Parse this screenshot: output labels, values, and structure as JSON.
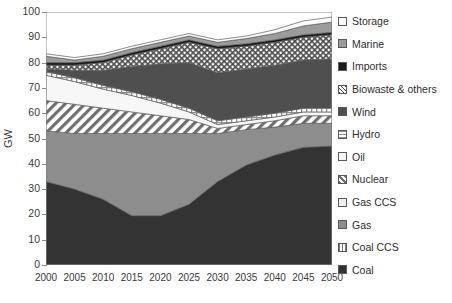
{
  "chart_data": {
    "type": "area",
    "stacked": true,
    "title": "",
    "xlabel": "",
    "ylabel": "GW",
    "x": [
      2000,
      2005,
      2010,
      2015,
      2020,
      2025,
      2030,
      2035,
      2040,
      2045,
      2050
    ],
    "categories": [
      "2000",
      "2005",
      "2010",
      "2015",
      "2020",
      "2025",
      "2030",
      "2035",
      "2040",
      "2045",
      "2050"
    ],
    "xlim": [
      2000,
      2050
    ],
    "ylim": [
      0,
      100
    ],
    "ytick_values": [
      0,
      10,
      20,
      30,
      40,
      50,
      60,
      70,
      80,
      90,
      100
    ],
    "ytick_labels": [
      "0",
      "10",
      "20",
      "30",
      "40",
      "50",
      "60",
      "70",
      "80",
      "90",
      "100"
    ],
    "grid": false,
    "legend_position": "right",
    "series": [
      {
        "name": "Coal",
        "pattern": "solid-darkest",
        "color": "#333333",
        "values": [
          33.0,
          30.0,
          26.0,
          19.5,
          19.5,
          24.0,
          33.0,
          39.5,
          43.5,
          46.5,
          47.0
        ]
      },
      {
        "name": "Coal CCS",
        "pattern": "vertical-lines",
        "color": "#8a8a8a",
        "values": [
          0.0,
          0.0,
          0.0,
          0.0,
          0.0,
          0.0,
          0.0,
          0.0,
          0.0,
          0.0,
          0.0
        ]
      },
      {
        "name": "Gas",
        "pattern": "solid-mid",
        "color": "#8d8d8d",
        "values": [
          20.0,
          22.0,
          26.0,
          32.5,
          32.5,
          28.0,
          19.0,
          14.0,
          11.0,
          9.5,
          9.0
        ]
      },
      {
        "name": "Gas CCS",
        "pattern": "light-plain",
        "color": "#efefef",
        "values": [
          0.0,
          0.0,
          0.0,
          0.0,
          0.0,
          0.0,
          0.0,
          0.0,
          0.0,
          0.0,
          0.0
        ]
      },
      {
        "name": "Nuclear",
        "pattern": "diagonal-hatch",
        "color": "#d6d6d6",
        "values": [
          12.0,
          11.5,
          10.0,
          8.5,
          7.0,
          5.5,
          2.0,
          2.0,
          2.5,
          3.0,
          3.0
        ]
      },
      {
        "name": "Oil",
        "pattern": "white-plain",
        "color": "#f7f7f7",
        "values": [
          10.0,
          9.0,
          7.5,
          6.5,
          5.0,
          3.0,
          1.5,
          1.5,
          1.5,
          1.5,
          1.5
        ]
      },
      {
        "name": "Hydro",
        "pattern": "grid-lines",
        "color": "#cfcfcf",
        "values": [
          1.5,
          1.5,
          1.5,
          1.5,
          1.5,
          1.5,
          1.5,
          1.5,
          1.5,
          1.5,
          1.5
        ]
      },
      {
        "name": "Wind",
        "pattern": "solid-dark",
        "color": "#4f4f4f",
        "values": [
          1.0,
          3.0,
          6.0,
          10.0,
          14.0,
          18.0,
          19.0,
          19.0,
          19.0,
          19.0,
          19.5
        ]
      },
      {
        "name": "Biowaste & others",
        "pattern": "fine-crosshatch",
        "color": "#bcbcbc",
        "values": [
          1.5,
          2.0,
          3.0,
          4.5,
          6.0,
          8.0,
          9.5,
          9.0,
          9.0,
          9.0,
          9.5
        ]
      },
      {
        "name": "Imports",
        "pattern": "solid-black",
        "color": "#1a1a1a",
        "values": [
          1.0,
          1.0,
          1.0,
          1.0,
          1.0,
          1.0,
          1.0,
          1.0,
          1.0,
          1.0,
          1.0
        ]
      },
      {
        "name": "Marine",
        "pattern": "solid-light",
        "color": "#9c9c9c",
        "values": [
          2.5,
          1.0,
          1.5,
          1.5,
          1.5,
          1.5,
          1.5,
          2.0,
          2.5,
          3.5,
          4.0
        ]
      },
      {
        "name": "Storage",
        "pattern": "white-outline",
        "color": "#fafafa",
        "values": [
          1.0,
          1.0,
          1.0,
          1.0,
          1.0,
          1.0,
          1.0,
          1.0,
          1.5,
          2.0,
          2.0
        ]
      }
    ],
    "totals": [
      83.5,
      82.0,
      83.5,
      86.5,
      89.0,
      91.5,
      89.0,
      89.5,
      91.5,
      95.5,
      97.0
    ]
  },
  "legend": {
    "items": [
      {
        "label": "Storage"
      },
      {
        "label": "Marine"
      },
      {
        "label": "Imports"
      },
      {
        "label": "Biowaste & others"
      },
      {
        "label": "Wind"
      },
      {
        "label": "Hydro"
      },
      {
        "label": "Oil"
      },
      {
        "label": "Nuclear"
      },
      {
        "label": "Gas CCS"
      },
      {
        "label": "Gas"
      },
      {
        "label": "Coal CCS"
      },
      {
        "label": "Coal"
      }
    ]
  }
}
